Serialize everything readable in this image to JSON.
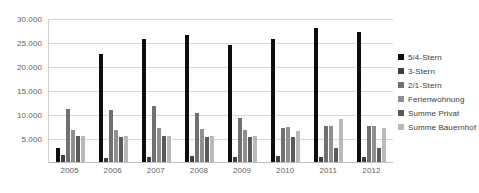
{
  "chart_data": {
    "type": "bar",
    "title": "",
    "xlabel": "",
    "ylabel": "",
    "categories": [
      "2005",
      "2006",
      "2007",
      "2008",
      "2009",
      "2010",
      "2011",
      "2012"
    ],
    "ylim": [
      0,
      30000
    ],
    "yticks": [
      "5.000",
      "10.000",
      "15.000",
      "20.000",
      "25.000",
      "30.000"
    ],
    "ytick_values": [
      5000,
      10000,
      15000,
      20000,
      25000,
      30000
    ],
    "grid": true,
    "legend_position": "right",
    "series": [
      {
        "name": "5/4-Stern",
        "color": "#0d0d0d",
        "values": [
          3000,
          22500,
          25700,
          26500,
          24300,
          25600,
          28000,
          27100
        ]
      },
      {
        "name": "3-Stern",
        "color": "#3f3f3f",
        "values": [
          1400,
          900,
          1100,
          1200,
          1100,
          1200,
          1100,
          1000
        ]
      },
      {
        "name": "2/1-Stern",
        "color": "#707070",
        "values": [
          11000,
          10800,
          11700,
          10200,
          9200,
          7000,
          7500,
          7400
        ]
      },
      {
        "name": "Ferienwohnung",
        "color": "#8f8f8f",
        "values": [
          6700,
          6600,
          7000,
          6900,
          6700,
          7300,
          7500,
          7400
        ]
      },
      {
        "name": "Summe Privat",
        "color": "#5a5a5a",
        "values": [
          5400,
          5300,
          5400,
          5300,
          5300,
          5300,
          3000,
          2900
        ]
      },
      {
        "name": "Summe Bauernhof",
        "color": "#b9b9b9",
        "values": [
          5400,
          5400,
          5500,
          5400,
          5400,
          6500,
          9000,
          7000
        ]
      }
    ]
  }
}
